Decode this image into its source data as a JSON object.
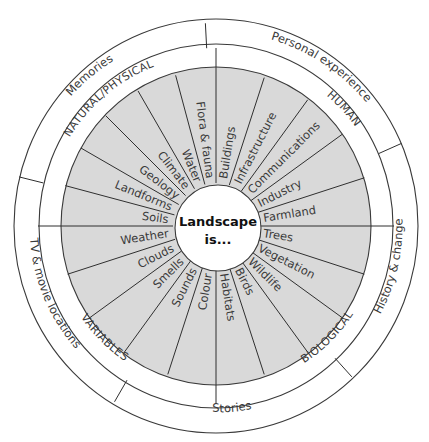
{
  "diagram": {
    "center": {
      "line1": "Landscape",
      "line2": "is..."
    },
    "outer_ring": [
      {
        "label": "Memories"
      },
      {
        "label": "Personal experience"
      },
      {
        "label": "History & change"
      },
      {
        "label": "Stories"
      },
      {
        "label": "TV & movie locations"
      }
    ],
    "categories": [
      {
        "label": "NATURAL/PHYSICAL"
      },
      {
        "label": "HUMAN"
      },
      {
        "label": "BIOLOGICAL"
      },
      {
        "label": "VARIABLES"
      }
    ],
    "segments": {
      "natural_physical": [
        "Soils",
        "Landforms",
        "Geology",
        "Climate",
        "Water",
        "Flora & fauna"
      ],
      "human": [
        "Buildings",
        "Infrastructure",
        "Communications",
        "Industry",
        "Farmland"
      ],
      "biological": [
        "Trees",
        "Vegetation",
        "Wildlife",
        "Birds",
        "Habitats"
      ],
      "variables": [
        "Colour",
        "Sounds",
        "Smells",
        "Clouds",
        "Weather"
      ]
    },
    "colors": {
      "segment_fill": "#d9d9d9",
      "line": "#3a3a3a",
      "background": "#ffffff"
    }
  }
}
